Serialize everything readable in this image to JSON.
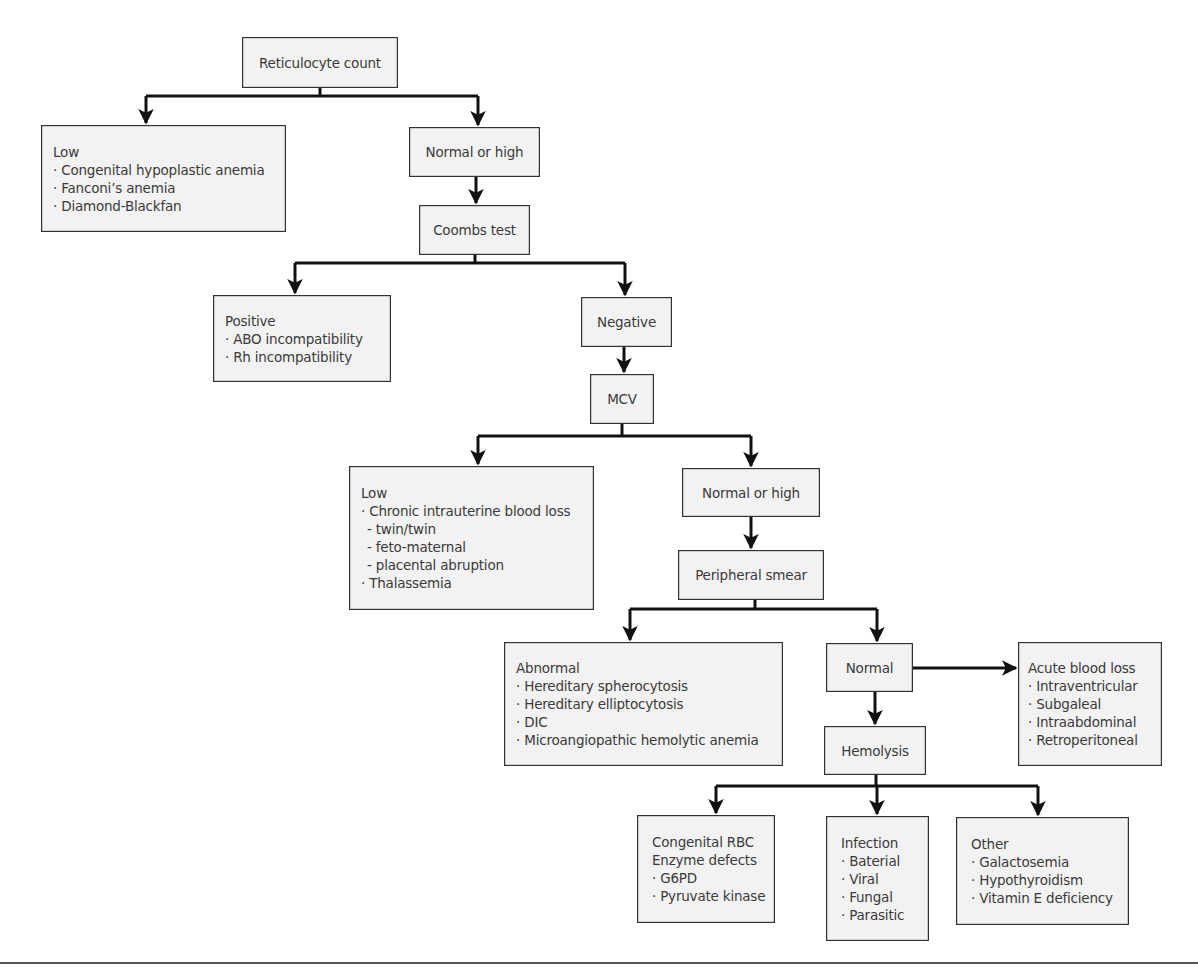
{
  "diagram": {
    "type": "flowchart",
    "colors": {
      "box_fill": "#f2f2f2",
      "box_border": "#333333",
      "line": "#111111",
      "text": "#3a3a3a"
    },
    "nodes": {
      "reticulocyte": {
        "title": "Reticulocyte count"
      },
      "retic_low": {
        "title": "Low",
        "items": [
          "· Congenital hypoplastic anemia",
          "· Fanconi’s anemia",
          "· Diamond-Blackfan"
        ]
      },
      "retic_normal_high": {
        "title": "Normal or high"
      },
      "coombs": {
        "title": "Coombs test"
      },
      "coombs_positive": {
        "title": "Positive",
        "items": [
          "· ABO incompatibility",
          "· Rh incompatibility"
        ]
      },
      "coombs_negative": {
        "title": "Negative"
      },
      "mcv": {
        "title": "MCV"
      },
      "mcv_low": {
        "title": "Low",
        "items": [
          "· Chronic intrauterine blood loss",
          "- twin/twin",
          "- feto-maternal",
          "- placental abruption",
          "· Thalassemia"
        ]
      },
      "mcv_normal_high": {
        "title": "Normal or high"
      },
      "smear": {
        "title": "Peripheral smear"
      },
      "smear_abnormal": {
        "title": "Abnormal",
        "items": [
          "· Hereditary spherocytosis",
          "· Hereditary elliptocytosis",
          "· DIC",
          "· Microangiopathic hemolytic anemia"
        ]
      },
      "smear_normal": {
        "title": "Normal"
      },
      "acute_blood_loss": {
        "title": "Acute blood loss",
        "items": [
          "· Intraventricular",
          "· Subgaleal",
          "· Intraabdominal",
          "· Retroperitoneal"
        ]
      },
      "hemolysis": {
        "title": "Hemolysis"
      },
      "congenital_rbc": {
        "title": "Congenital RBC",
        "items": [
          "Enzyme defects",
          "· G6PD",
          "· Pyruvate kinase"
        ]
      },
      "infection": {
        "title": "Infection",
        "items": [
          "· Baterial",
          "· Viral",
          "· Fungal",
          "· Parasitic"
        ]
      },
      "other": {
        "title": "Other",
        "items": [
          "· Galactosemia",
          "· Hypothyroidism",
          "· Vitamin E deficiency"
        ]
      }
    },
    "edges": [
      [
        "reticulocyte",
        "retic_low"
      ],
      [
        "reticulocyte",
        "retic_normal_high"
      ],
      [
        "retic_normal_high",
        "coombs"
      ],
      [
        "coombs",
        "coombs_positive"
      ],
      [
        "coombs",
        "coombs_negative"
      ],
      [
        "coombs_negative",
        "mcv"
      ],
      [
        "mcv",
        "mcv_low"
      ],
      [
        "mcv",
        "mcv_normal_high"
      ],
      [
        "mcv_normal_high",
        "smear"
      ],
      [
        "smear",
        "smear_abnormal"
      ],
      [
        "smear",
        "smear_normal"
      ],
      [
        "smear_normal",
        "acute_blood_loss"
      ],
      [
        "smear_normal",
        "hemolysis"
      ],
      [
        "hemolysis",
        "congenital_rbc"
      ],
      [
        "hemolysis",
        "infection"
      ],
      [
        "hemolysis",
        "other"
      ]
    ]
  }
}
